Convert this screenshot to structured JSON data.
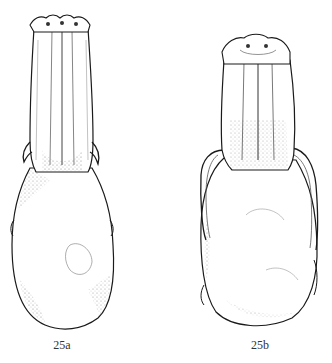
{
  "plate": {
    "figures": [
      {
        "label": "25a",
        "view": "skull-dorsal"
      },
      {
        "label": "25b",
        "view": "skull-dorsal"
      }
    ]
  },
  "colors": {
    "background": "#ffffff",
    "ink": "#1a1a1a",
    "shade": "#8a8a8a",
    "caption": "#333333"
  }
}
